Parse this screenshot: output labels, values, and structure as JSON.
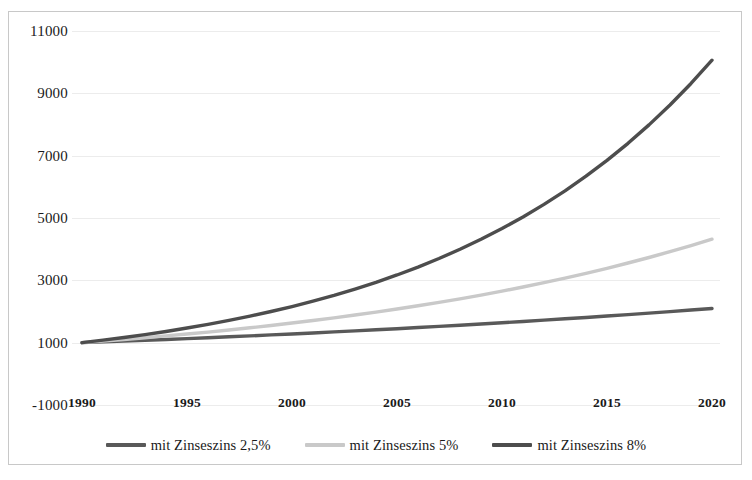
{
  "chart_data": {
    "type": "line",
    "title": "",
    "subtitle": "",
    "xlabel": "",
    "ylabel": "",
    "xlim": [
      1990,
      2020
    ],
    "ylim": [
      -1000,
      11000
    ],
    "grid": true,
    "legend_position": "bottom",
    "x_ticks": [
      "1990",
      "1995",
      "2000",
      "2005",
      "2010",
      "2015",
      "2020"
    ],
    "y_ticks": [
      "11000",
      "9000",
      "7000",
      "5000",
      "3000",
      "1000",
      "-1000"
    ],
    "x": [
      1990,
      1991,
      1992,
      1993,
      1994,
      1995,
      1996,
      1997,
      1998,
      1999,
      2000,
      2001,
      2002,
      2003,
      2004,
      2005,
      2006,
      2007,
      2008,
      2009,
      2010,
      2011,
      2012,
      2013,
      2014,
      2015,
      2016,
      2017,
      2018,
      2019,
      2020
    ],
    "series": [
      {
        "name": "mit Zinseszins 2,5%",
        "color": "#595959",
        "rate": 2.5,
        "start_value": 1000,
        "end_value": 2098,
        "values": [
          1000,
          1025,
          1051,
          1077,
          1104,
          1131,
          1160,
          1189,
          1218,
          1249,
          1280,
          1312,
          1345,
          1379,
          1413,
          1448,
          1485,
          1522,
          1560,
          1599,
          1639,
          1680,
          1722,
          1765,
          1809,
          1854,
          1900,
          1948,
          1997,
          2046,
          2098
        ]
      },
      {
        "name": "mit Zinseszins 5%",
        "color": "#c9c9c9",
        "rate": 5,
        "start_value": 1000,
        "end_value": 4322,
        "values": [
          1000,
          1050,
          1103,
          1158,
          1216,
          1276,
          1340,
          1407,
          1477,
          1551,
          1629,
          1710,
          1796,
          1886,
          1980,
          2079,
          2183,
          2292,
          2407,
          2527,
          2653,
          2786,
          2925,
          3072,
          3225,
          3386,
          3556,
          3733,
          3920,
          4116,
          4322
        ]
      },
      {
        "name": "mit Zinseszins 8%",
        "color": "#4d4d4d",
        "rate": 8,
        "start_value": 1000,
        "end_value": 10063,
        "values": [
          1000,
          1080,
          1166,
          1260,
          1360,
          1469,
          1587,
          1714,
          1851,
          1999,
          2159,
          2332,
          2518,
          2720,
          2937,
          3172,
          3426,
          3700,
          3996,
          4316,
          4661,
          5034,
          5437,
          5871,
          6341,
          6848,
          7396,
          7988,
          8627,
          9317,
          10063
        ]
      }
    ]
  },
  "legend": {
    "items": [
      {
        "label": "mit Zinseszins 2,5%",
        "color": "#595959"
      },
      {
        "label": "mit Zinseszins 5%",
        "color": "#c9c9c9"
      },
      {
        "label": "mit Zinseszins 8%",
        "color": "#4d4d4d"
      }
    ]
  },
  "colors": {
    "frame_border": "#c8c8c8",
    "gridline": "#ececec",
    "text": "#1a1a1a",
    "background": "#ffffff"
  }
}
